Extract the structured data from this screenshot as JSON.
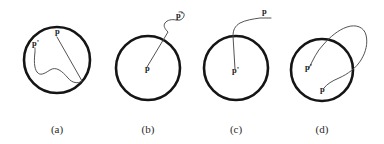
{
  "figure": {
    "background_color": "#ffffff",
    "circle_stroke_color": "#151515",
    "curve_stroke_color": "#4a4a4a",
    "label_color": "#1b1b1b",
    "caption_color": "#2a2a2a",
    "panels": [
      {
        "id": "panel-a",
        "caption": "(a)",
        "caption_x": 57,
        "caption_y": 133,
        "circle": {
          "cx": 57,
          "cy": 60,
          "r": 33
        },
        "labels": [
          {
            "name": "label-p",
            "text": "p",
            "x": 55,
            "y": 34
          },
          {
            "name": "label-p-prime",
            "text": "p'",
            "x": 32,
            "y": 46
          }
        ],
        "curve": "M 57 37 L 82 81 C 78 84 72 83 68 78 C 62 71 56 66 50 70 C 44 74 40 76 37 72 C 34 68 34 60 35 52 C 35 50 35 49 35 48"
      },
      {
        "id": "panel-b",
        "caption": "(b)",
        "caption_x": 148,
        "caption_y": 133,
        "circle": {
          "cx": 148,
          "cy": 68,
          "r": 32
        },
        "labels": [
          {
            "name": "label-p",
            "text": "p",
            "x": 145,
            "y": 71
          },
          {
            "name": "label-p-prime",
            "text": "p'",
            "x": 176,
            "y": 18
          }
        ],
        "curve": "M 147 67 L 168 32 C 165 29 163 26 165 23 C 167 20 172 19 176 20 C 180 21 183 19 184 16 C 185 13 182 11 179 12"
      },
      {
        "id": "panel-c",
        "caption": "(c)",
        "caption_x": 236,
        "caption_y": 133,
        "circle": {
          "cx": 236,
          "cy": 68,
          "r": 32
        },
        "labels": [
          {
            "name": "label-p-prime",
            "text": "p'",
            "x": 232,
            "y": 73
          },
          {
            "name": "label-p",
            "text": "p",
            "x": 262,
            "y": 14
          }
        ],
        "curve": "M 235 69 L 233 36 C 233 30 235 26 240 23 C 246 20 253 19 260 18 C 264 18 268 18 271 18"
      },
      {
        "id": "panel-d",
        "caption": "(d)",
        "caption_x": 322,
        "caption_y": 133,
        "circle": {
          "cx": 322,
          "cy": 70,
          "r": 31
        },
        "labels": [
          {
            "name": "label-p-prime",
            "text": "p'",
            "x": 305,
            "y": 70
          },
          {
            "name": "label-p",
            "text": "p",
            "x": 320,
            "y": 92
          }
        ],
        "curve": "M 309 68 C 313 60 317 51 323 45 C 330 37 338 30 347 27 C 356 24 364 27 366 35 C 368 43 366 52 361 60 C 356 68 348 74 339 78 C 332 81 327 84 324 88"
      }
    ]
  }
}
